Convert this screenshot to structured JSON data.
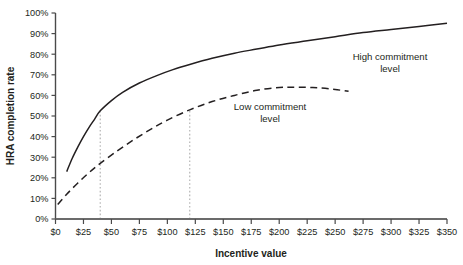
{
  "chart_data": {
    "type": "line",
    "title": "",
    "xlabel": "Incentive value",
    "ylabel": "HRA completion rate",
    "xlim": [
      0,
      350
    ],
    "ylim": [
      0,
      100
    ],
    "grid": false,
    "legend_position": "inline-annotation",
    "x_ticks": [
      "$0",
      "$25",
      "$50",
      "$75",
      "$100",
      "$125",
      "$150",
      "$175",
      "$200",
      "$225",
      "$250",
      "$275",
      "$300",
      "$325",
      "$350"
    ],
    "x_tick_values": [
      0,
      25,
      50,
      75,
      100,
      125,
      150,
      175,
      200,
      225,
      250,
      275,
      300,
      325,
      350
    ],
    "y_ticks": [
      "0%",
      "10%",
      "20%",
      "30%",
      "40%",
      "50%",
      "60%",
      "70%",
      "80%",
      "90%",
      "100%"
    ],
    "y_tick_values": [
      0,
      10,
      20,
      30,
      40,
      50,
      60,
      70,
      80,
      90,
      100
    ],
    "series": [
      {
        "name": "High commitment level",
        "style": "solid",
        "color": "#231f20",
        "label_lines": [
          "High commitment",
          "level"
        ],
        "x": [
          10,
          15,
          20,
          25,
          30,
          35,
          40,
          50,
          60,
          75,
          90,
          105,
          120,
          140,
          160,
          180,
          200,
          225,
          250,
          275,
          300,
          325,
          350
        ],
        "values": [
          23,
          29.5,
          35,
          40,
          44.5,
          48.5,
          52.5,
          57.5,
          61.5,
          66,
          69.5,
          72.5,
          75,
          78,
          80.5,
          82.5,
          84.5,
          86.5,
          88.5,
          90.5,
          92,
          93.5,
          95
        ]
      },
      {
        "name": "Low commitment level",
        "style": "dashed",
        "color": "#231f20",
        "label_lines": [
          "Low commitment",
          "level"
        ],
        "x": [
          2,
          10,
          20,
          30,
          40,
          55,
          70,
          85,
          100,
          120,
          140,
          160,
          180,
          200,
          215,
          230,
          245,
          262
        ],
        "values": [
          7,
          12,
          17.5,
          22.5,
          27,
          33,
          38.5,
          43.5,
          48,
          53,
          57,
          60,
          62.5,
          63.8,
          64,
          63.8,
          63.2,
          62
        ]
      }
    ],
    "reference_lines": [
      {
        "name": "high-commitment-reference",
        "x": 40,
        "y_top": 52.5,
        "style": "dotted",
        "color": "#b5b5b5"
      },
      {
        "name": "low-commitment-reference",
        "x": 120,
        "y_top": 53,
        "style": "dotted",
        "color": "#b5b5b5"
      }
    ]
  }
}
